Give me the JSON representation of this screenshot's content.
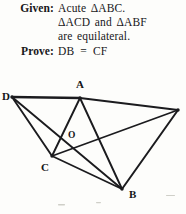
{
  "statement": {
    "given_label": "Given:",
    "given_line1": "Acute ΔABC.",
    "given_line2": "ΔACD and ΔABF",
    "given_line3": "are equilateral.",
    "prove_label": "Prove:",
    "prove_body": "DB  =  CF"
  },
  "figure": {
    "ink_color": "#1b1b1e",
    "background_color": "#fdfdfb",
    "labels": {
      "A": "A",
      "B": "B",
      "C": "C",
      "D": "D",
      "O": "O"
    },
    "vertices": [
      {
        "name": "D",
        "x": 12,
        "y": 29,
        "labeled": true,
        "label_x": 2,
        "label_y": 32
      },
      {
        "name": "A",
        "x": 80,
        "y": 30,
        "labeled": true,
        "label_x": 76,
        "label_y": 20
      },
      {
        "name": "F",
        "x": 178,
        "y": 42,
        "labeled": false,
        "label_x": 0,
        "label_y": 0
      },
      {
        "name": "C",
        "x": 52,
        "y": 88,
        "labeled": true,
        "label_x": 41,
        "label_y": 103
      },
      {
        "name": "B",
        "x": 122,
        "y": 121,
        "labeled": true,
        "label_x": 129,
        "label_y": 130
      },
      {
        "name": "O",
        "x": 66,
        "y": 71,
        "labeled": true,
        "label_x": 68,
        "label_y": 70
      }
    ],
    "segments": [
      {
        "name": "DA",
        "from": "D",
        "to": "A",
        "weight": 2.4
      },
      {
        "name": "AF",
        "from": "A",
        "to": "F",
        "weight": 2.1
      },
      {
        "name": "DC",
        "from": "D",
        "to": "C",
        "weight": 1.9
      },
      {
        "name": "DB",
        "from": "D",
        "to": "B",
        "weight": 1.9
      },
      {
        "name": "AC",
        "from": "A",
        "to": "C",
        "weight": 1.9
      },
      {
        "name": "AB",
        "from": "A",
        "to": "B",
        "weight": 1.9
      },
      {
        "name": "CB",
        "from": "C",
        "to": "B",
        "weight": 1.7
      },
      {
        "name": "CF",
        "from": "C",
        "to": "F",
        "weight": 1.7
      },
      {
        "name": "FB",
        "from": "F",
        "to": "B",
        "weight": 2.0
      }
    ]
  }
}
